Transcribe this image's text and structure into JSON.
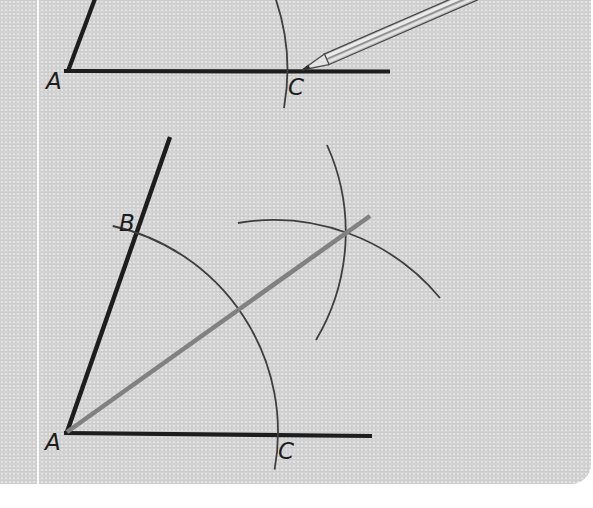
{
  "figures": {
    "top": {
      "labels": {
        "a": "A",
        "c": "C"
      },
      "icon": "pencil"
    },
    "bottom": {
      "labels": {
        "a": "A",
        "b": "B",
        "c": "C"
      }
    }
  },
  "colors": {
    "page_background": "#ffffff",
    "panel_background": "#d3d3d3",
    "divider_line": "#fafafa",
    "ray": "#1d1d1d",
    "arc": "#3e3e3e",
    "bisector": "#818181",
    "label": "#1d1d1d",
    "pencil_outline": "#4a4a4a",
    "pencil_body": "#bfbfbf",
    "pencil_highlight": "#ebebeb",
    "pencil_shadow": "#8f8f8f",
    "pencil_wood": "#e3e3e3",
    "pencil_lead": "#2e2e2e"
  }
}
